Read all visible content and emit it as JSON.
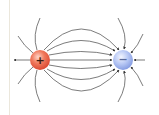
{
  "diagram": {
    "type": "electric-dipole-field-lines",
    "positive_charge": {
      "label": "+",
      "color": "#e8523c",
      "cx": 40,
      "cy": 60,
      "r": 10
    },
    "negative_charge": {
      "label": "−",
      "color": "#8aa6e8",
      "cx": 123,
      "cy": 60,
      "r": 10
    },
    "line_color": "#3a3a3a",
    "border_color": "#ebe7dc"
  }
}
